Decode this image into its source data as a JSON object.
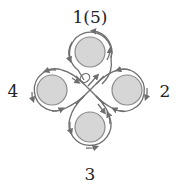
{
  "diagram": {
    "title": "",
    "labels": {
      "top": "1(5)",
      "right": "2",
      "bottom": "3",
      "left": "4"
    },
    "nodes": [
      {
        "id": "rotor-1",
        "label": "1(5)",
        "position": "top",
        "cx": 90,
        "cy": 52
      },
      {
        "id": "rotor-2",
        "label": "2",
        "position": "right",
        "cx": 127,
        "cy": 90
      },
      {
        "id": "rotor-3",
        "label": "3",
        "position": "bottom",
        "cx": 90,
        "cy": 127
      },
      {
        "id": "rotor-4",
        "label": "4",
        "position": "left",
        "cx": 52,
        "cy": 90
      }
    ],
    "paths": "Each rotor is encircled by a directed loop path with arrowheads; the four loops cross at the center, with a small ellipse marker and arrow near the center just below rotor 1.",
    "colors": {
      "rotor_fill": "#d6d6d6",
      "rotor_stroke": "#8a8a8a",
      "path_stroke": "#6e6e6e",
      "label_text": "#222222",
      "background": "#ffffff"
    }
  }
}
